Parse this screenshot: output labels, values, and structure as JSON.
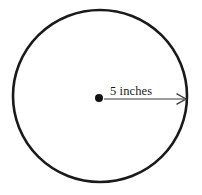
{
  "figure": {
    "background_color": "#ffffff",
    "stroke_color": "#1a1a1a",
    "circle": {
      "center_x": 100,
      "center_y": 96,
      "radius_x": 87,
      "radius_y": 86,
      "stroke_width": 2.6,
      "fill": "none"
    },
    "center_dot": {
      "x": 99,
      "y": 98,
      "radius": 4,
      "color": "#111111"
    },
    "radius_arrow": {
      "start_x": 104,
      "start_y": 99,
      "end_x": 186,
      "end_y": 99,
      "stroke_width": 1.2,
      "color": "#3a3a3a",
      "arrowhead": "open-v"
    },
    "radius_label": {
      "text": "5 inches",
      "value": 5,
      "unit": "inches",
      "x": 110,
      "y": 95,
      "font_size": 12.5
    }
  }
}
